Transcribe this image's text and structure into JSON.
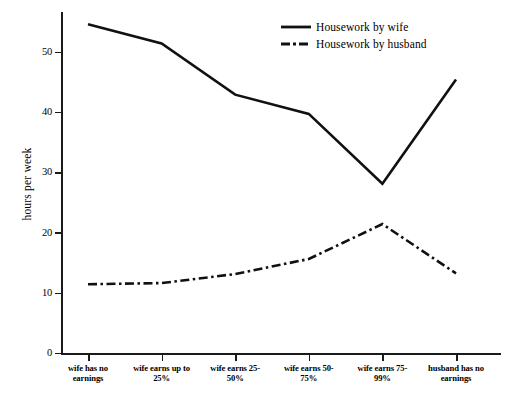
{
  "chart_data": {
    "type": "line",
    "title": "",
    "xlabel": "",
    "ylabel": "hours per week",
    "ylim": [
      0,
      57
    ],
    "yticks": [
      0,
      10,
      20,
      30,
      40,
      50
    ],
    "grid": false,
    "legend_position": "top-right",
    "categories": [
      "wife has no earnings",
      "wife earns up to 25%",
      "wife earns 25-50%",
      "wife earns 50-75%",
      "wife earns 75-99%",
      "husband has no earnings"
    ],
    "series": [
      {
        "name": "Housework by wife",
        "style": "solid",
        "color": "#111111",
        "values": [
          54.7,
          51.5,
          43.0,
          39.8,
          28.2,
          45.5
        ]
      },
      {
        "name": "Housework by husband",
        "style": "dash-dot",
        "color": "#111111",
        "values": [
          11.5,
          11.7,
          13.2,
          15.7,
          21.5,
          13.3
        ]
      }
    ]
  },
  "axis": {
    "y_title": "hours per week",
    "y_tick_labels": [
      "0",
      "10",
      "20",
      "30",
      "40",
      "50"
    ]
  },
  "x_labels": [
    [
      "wife has no",
      "earnings"
    ],
    [
      "wife earns up to",
      "25%"
    ],
    [
      "wife earns 25-",
      "50%"
    ],
    [
      "wife earns 50-",
      "75%"
    ],
    [
      "wife earns 75-",
      "99%"
    ],
    [
      "husband has no",
      "earnings"
    ]
  ],
  "legend": {
    "items": [
      {
        "label": "Housework by wife",
        "style": "solid"
      },
      {
        "label": "Housework by husband",
        "style": "dash-dot"
      }
    ]
  }
}
